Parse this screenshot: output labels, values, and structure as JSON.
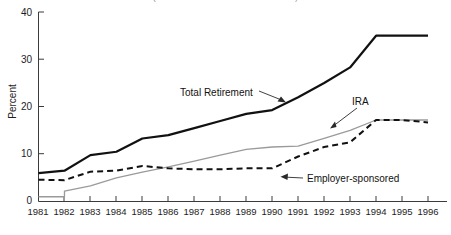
{
  "chart_data": {
    "type": "line",
    "title": "(Percent of all households with assets)",
    "xlabel": "",
    "ylabel": "Percent",
    "x": [
      1981,
      1982,
      1983,
      1984,
      1985,
      1986,
      1987,
      1988,
      1989,
      1990,
      1991,
      1992,
      1993,
      1994,
      1995,
      1996
    ],
    "xtick_labels": [
      "1981",
      "1982",
      "1983",
      "1984",
      "1985",
      "1986",
      "1987",
      "1988",
      "1989",
      "1990",
      "1991",
      "1992",
      "1993",
      "1994",
      "1995",
      "1996"
    ],
    "ytick_labels": [
      "0",
      "10",
      "20",
      "30",
      "40"
    ],
    "yticks": [
      0,
      10,
      20,
      30,
      40
    ],
    "ylim": [
      0,
      40
    ],
    "xlim": [
      1981,
      1996
    ],
    "grid": false,
    "legend": "none",
    "series": [
      {
        "name": "Total Retirement",
        "style": "solid-black-thick",
        "color": "#111111",
        "values": [
          6.0,
          6.5,
          9.8,
          10.5,
          13.3,
          14.0,
          15.5,
          17.0,
          18.5,
          19.3,
          22.0,
          25.0,
          28.3,
          35.0,
          35.0,
          35.0
        ]
      },
      {
        "name": "IRA",
        "style": "solid-gray-thin",
        "color": "#9a9a9a",
        "values": [
          1.0,
          2.2,
          3.3,
          5.0,
          6.2,
          7.3,
          8.5,
          9.8,
          11.0,
          11.5,
          11.7,
          13.3,
          15.0,
          17.2,
          17.2,
          17.2
        ]
      },
      {
        "name": "Employer-sponsored",
        "style": "dashed-black",
        "color": "#111111",
        "values": [
          4.6,
          4.5,
          6.3,
          6.5,
          7.5,
          7.0,
          6.8,
          6.8,
          7.0,
          7.0,
          9.5,
          11.5,
          12.5,
          17.2,
          17.2,
          16.7
        ]
      }
    ],
    "annotations": [
      {
        "text": "Total Retirement",
        "points_to_series": "Total Retirement",
        "points_to_x": 1989
      },
      {
        "text": "IRA",
        "points_to_series": "IRA",
        "points_to_x": 1992
      },
      {
        "text": "Employer-sponsored",
        "points_to_series": "Employer-sponsored",
        "points_to_x": 1990
      }
    ]
  }
}
